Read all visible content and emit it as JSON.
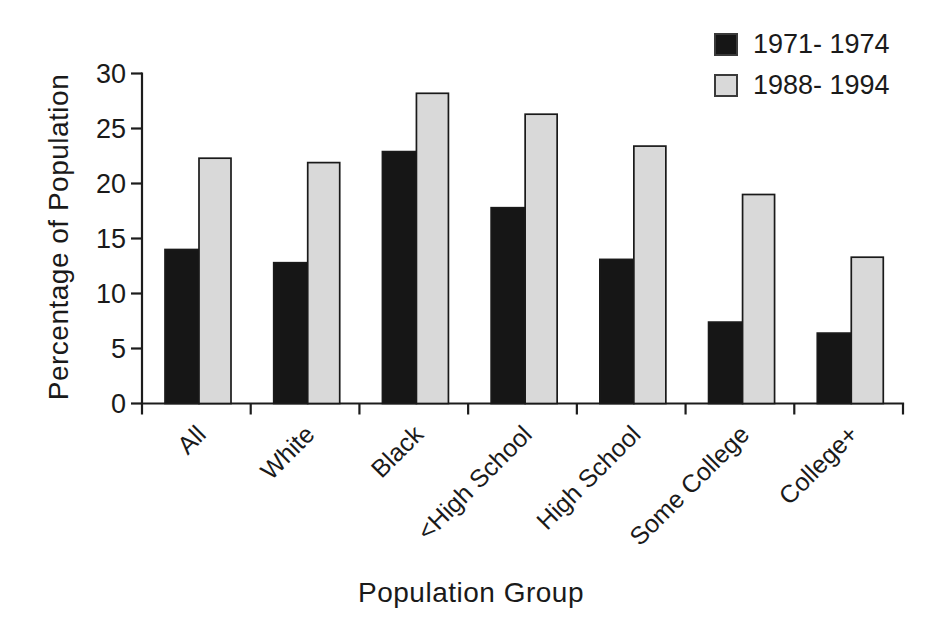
{
  "chart_data": {
    "type": "bar",
    "title": "",
    "xlabel": "Population Group",
    "ylabel": "Percentage of Population",
    "categories": [
      "All",
      "White",
      "Black",
      "<High School",
      "High School",
      "Some College",
      "College+"
    ],
    "series": [
      {
        "name": "1971- 1974",
        "color": "#161616",
        "values": [
          14.0,
          12.8,
          22.9,
          17.8,
          13.1,
          7.4,
          6.4
        ]
      },
      {
        "name": "1988- 1994",
        "color": "#d9d9d9",
        "values": [
          22.3,
          21.9,
          28.2,
          26.3,
          23.4,
          19.0,
          13.3
        ]
      }
    ],
    "ylim": [
      0,
      30
    ],
    "yticks": [
      0,
      5,
      10,
      15,
      20,
      25,
      30
    ],
    "grid": false,
    "legend_position": "top-right",
    "axis_color": "#1c1c1c",
    "bar_border_color": "#1a1a1a",
    "text_color": "#1a1a1a"
  }
}
